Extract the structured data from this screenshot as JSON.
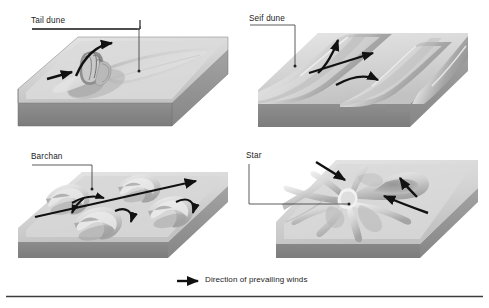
{
  "figure": {
    "background_color": "#ffffff",
    "ink_color": "#1a1a1a",
    "sand_light": "#e2e2e2",
    "sand_mid": "#c9c9c9",
    "sand_shadow": "#9d9d9d",
    "block_side": "#8f8f8f",
    "block_front": "#7e7e7e"
  },
  "panels": [
    {
      "id": "tail-dune",
      "label": "Tail dune",
      "position": "top-left",
      "arrows": [
        {
          "name": "incoming-wind-arrow",
          "kind": "straight"
        },
        {
          "name": "deflected-wind-arrow",
          "kind": "curved"
        }
      ],
      "features": [
        "rocky-obstacle",
        "sand-tail"
      ]
    },
    {
      "id": "seif-dune",
      "label": "Seif dune",
      "position": "top-right",
      "arrows": [
        {
          "name": "wind-arrow-upper",
          "kind": "curved"
        },
        {
          "name": "wind-arrow-middle",
          "kind": "straight"
        },
        {
          "name": "wind-arrow-lower",
          "kind": "curved"
        }
      ],
      "features": [
        "linear-ridge-1",
        "linear-ridge-2",
        "linear-ridge-3"
      ]
    },
    {
      "id": "barchan",
      "label": "Barchan",
      "position": "bottom-left",
      "arrows": [
        {
          "name": "main-wind-arrow",
          "kind": "straight"
        },
        {
          "name": "horn-eddy-arrow-1",
          "kind": "curved"
        },
        {
          "name": "horn-eddy-arrow-2",
          "kind": "curved"
        },
        {
          "name": "horn-eddy-arrow-3",
          "kind": "curved"
        }
      ],
      "features": [
        "crescent-dune-1",
        "crescent-dune-2",
        "crescent-dune-3",
        "crescent-dune-4"
      ]
    },
    {
      "id": "star-dune",
      "label": "Star",
      "position": "bottom-right",
      "arrows": [
        {
          "name": "wind-arrow-from-northwest",
          "kind": "straight"
        },
        {
          "name": "wind-arrow-from-southeast",
          "kind": "curved"
        },
        {
          "name": "wind-arrow-from-south",
          "kind": "straight"
        }
      ],
      "features": [
        "radiating-arm-1",
        "radiating-arm-2",
        "radiating-arm-3",
        "radiating-arm-4",
        "central-peak"
      ]
    }
  ],
  "legend": {
    "arrow_icon": "right-arrow-icon",
    "text": "Direction of prevailing winds"
  }
}
